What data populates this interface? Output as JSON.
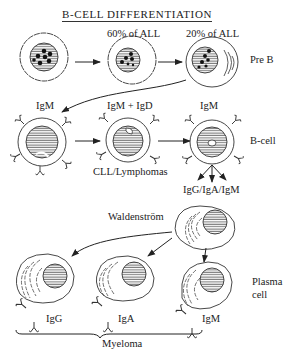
{
  "title": "B-CELL DIFFERENTIATION",
  "stages": {
    "pre_b": {
      "label": "Pre B",
      "cells": [
        {
          "annotation": ""
        },
        {
          "annotation": "60% of ALL"
        },
        {
          "annotation": "20% of ALL"
        }
      ]
    },
    "b_cell": {
      "label": "B-cell",
      "cells": [
        {
          "annotation": "IgM"
        },
        {
          "annotation": "IgM + IgD"
        },
        {
          "annotation": "IgM"
        }
      ],
      "disease_label": "CLL/Lymphomas",
      "output_label": "IgG/IgA/IgM"
    },
    "plasma": {
      "label_line1": "Plasma",
      "label_line2": "cell",
      "source_label": "Waldenström",
      "cells": [
        {
          "antibody": "IgG"
        },
        {
          "antibody": "IgA"
        },
        {
          "antibody": "IgM"
        }
      ],
      "disease_label": "Myeloma"
    }
  },
  "colors": {
    "ink": "#222222",
    "background": "#ffffff"
  }
}
